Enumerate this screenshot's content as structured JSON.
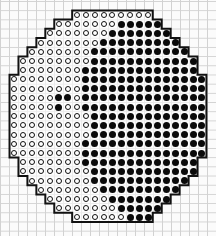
{
  "figure": {
    "legend": [
      {
        "symbol": "open-circle",
        "color": "#ffffff",
        "outline": "#111111"
      },
      {
        "symbol": "filled-circle",
        "color": "#0a0a0a"
      }
    ],
    "grid": {
      "columns": 22,
      "rows": 23,
      "origin_x": 14,
      "origin_y": 15,
      "pitch_x": 8.95,
      "pitch_y": 9.2
    },
    "rows": [
      {
        "start": 7,
        "end": 15,
        "filled": []
      },
      {
        "start": 5,
        "end": 16,
        "filled": [
          12,
          13,
          14,
          15,
          16
        ]
      },
      {
        "start": 4,
        "end": 17,
        "filled": [
          11,
          12,
          13,
          14,
          15,
          16,
          17
        ]
      },
      {
        "start": 3,
        "end": 18,
        "filled": [
          10,
          11,
          12,
          13,
          14,
          15,
          16,
          17,
          18
        ]
      },
      {
        "start": 2,
        "end": 19,
        "filled": [
          9,
          10,
          11,
          12,
          13,
          14,
          15,
          16,
          17,
          18,
          19
        ]
      },
      {
        "start": 1,
        "end": 20,
        "filled": [
          9,
          10,
          11,
          12,
          13,
          14,
          15,
          16,
          17,
          18,
          19,
          20
        ]
      },
      {
        "start": 1,
        "end": 20,
        "filled": [
          8,
          9,
          10,
          11,
          12,
          13,
          14,
          15,
          16,
          17,
          18,
          19,
          20
        ]
      },
      {
        "start": 0,
        "end": 21,
        "filled": [
          8,
          9,
          10,
          11,
          12,
          13,
          14,
          15,
          16,
          17,
          18,
          19,
          20,
          21
        ]
      },
      {
        "start": 0,
        "end": 21,
        "filled": [
          8,
          9,
          10,
          11,
          12,
          13,
          14,
          15,
          16,
          17,
          18,
          19,
          20,
          21
        ]
      },
      {
        "start": 0,
        "end": 21,
        "filled": [
          5,
          6,
          8,
          9,
          10,
          11,
          12,
          13,
          14,
          15,
          16,
          17,
          18,
          19,
          20,
          21
        ]
      },
      {
        "start": 0,
        "end": 21,
        "filled": [
          5,
          8,
          9,
          10,
          11,
          12,
          13,
          14,
          15,
          16,
          17,
          18,
          19,
          20,
          21
        ]
      },
      {
        "start": 0,
        "end": 21,
        "filled": [
          9,
          10,
          11,
          12,
          13,
          14,
          15,
          16,
          17,
          18,
          19,
          20,
          21
        ]
      },
      {
        "start": 0,
        "end": 21,
        "filled": [
          9,
          10,
          11,
          12,
          13,
          14,
          15,
          16,
          17,
          18,
          19,
          20,
          21
        ]
      },
      {
        "start": 0,
        "end": 21,
        "filled": [
          9,
          10,
          11,
          12,
          13,
          14,
          15,
          16,
          17,
          18,
          19,
          20,
          21
        ]
      },
      {
        "start": 0,
        "end": 21,
        "filled": [
          8,
          9,
          10,
          11,
          12,
          13,
          14,
          15,
          16,
          17,
          18,
          19,
          20,
          21
        ]
      },
      {
        "start": 0,
        "end": 21,
        "filled": [
          8,
          9,
          10,
          11,
          12,
          13,
          14,
          15,
          16,
          17,
          18,
          19,
          20,
          21
        ]
      },
      {
        "start": 1,
        "end": 20,
        "filled": [
          8,
          9,
          10,
          11,
          12,
          13,
          14,
          15,
          16,
          17,
          18,
          19,
          20
        ]
      },
      {
        "start": 1,
        "end": 20,
        "filled": [
          9,
          10,
          11,
          12,
          13,
          14,
          15,
          16,
          17,
          18,
          19,
          20
        ]
      },
      {
        "start": 2,
        "end": 19,
        "filled": [
          9,
          10,
          11,
          12,
          13,
          14,
          15,
          16,
          17,
          18,
          19
        ]
      },
      {
        "start": 3,
        "end": 18,
        "filled": [
          10,
          11,
          12,
          13,
          14,
          15,
          16,
          17,
          18
        ]
      },
      {
        "start": 4,
        "end": 17,
        "filled": [
          11,
          12,
          13,
          14,
          15,
          16,
          17
        ]
      },
      {
        "start": 5,
        "end": 16,
        "filled": [
          12,
          13,
          14,
          15,
          16
        ]
      },
      {
        "start": 7,
        "end": 15,
        "filled": [
          13,
          14,
          15
        ]
      }
    ]
  }
}
